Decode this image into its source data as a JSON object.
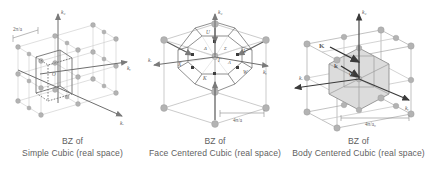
{
  "figure": {
    "background": "#ffffff",
    "line_color": "#8a8a8a",
    "faint_line_color": "#c9c9c9",
    "sphere_color": "#b0b0b0",
    "shade_color": "#d9d9d9",
    "text_color": "#5a5a5a"
  },
  "panels": [
    {
      "id": "simple-cubic",
      "caption_line1": "BZ of",
      "caption_line2": "Simple Cubic (real space)",
      "dimension_label": "2π/a",
      "axes": [
        "kₓ",
        "kᵧ",
        "k₂"
      ],
      "axis_x": "kₓ",
      "axis_y": "kᵧ",
      "axis_z": "k₂",
      "origin_label": "O",
      "zone_shape": "cube",
      "lattice_points": 27,
      "notes": "Cubic Brillouin zone centred at origin within a 3×3×3 array of reciprocal lattice points"
    },
    {
      "id": "face-centered-cubic",
      "caption_line1": "BZ of",
      "caption_line2": "Face Centered Cubic (real space)",
      "dimension_label": "4π/a",
      "axis_x": "kₓ",
      "axis_y": "kᵧ",
      "axis_z": "k₂",
      "origin_label": "Γ",
      "zone_shape": "truncated octahedron",
      "high_symmetry_points": [
        {
          "label": "Γ",
          "desc": "zone centre"
        },
        {
          "label": "L",
          "desc": "hexagonal face centre"
        },
        {
          "label": "X",
          "desc": "square face centre"
        },
        {
          "label": "K",
          "desc": "edge midpoint"
        },
        {
          "label": "W",
          "desc": "corner"
        },
        {
          "label": "U",
          "desc": "square-hexagon edge"
        },
        {
          "label": "Δ",
          "desc": "Γ–X line"
        },
        {
          "label": "Σ",
          "desc": "Γ–K line"
        },
        {
          "label": "Λ",
          "desc": "Γ–L line"
        }
      ],
      "lattice_points": 8
    },
    {
      "id": "body-centered-cubic",
      "caption_line1": "BZ of",
      "caption_line2": "Body Centered Cubic (real space)",
      "dimension_label": "4π/a₀",
      "axis_x": "kₓ",
      "axis_y": "kᵧ",
      "axis_z": "k₂",
      "origin_label": "O",
      "vector_K": "K",
      "vector_k": "k",
      "zone_shape": "rhombic dodecahedron",
      "lattice_points": 14
    }
  ]
}
